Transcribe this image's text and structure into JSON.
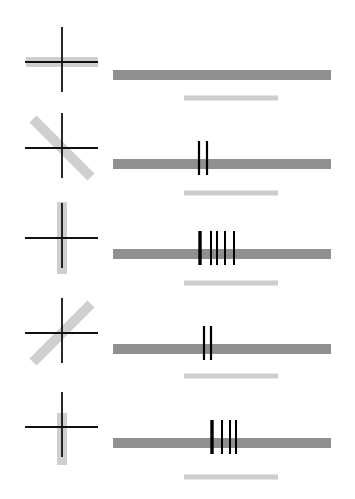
{
  "diagram": {
    "colors": {
      "crosshair": "#111111",
      "orientation_bar": "#cfcfcf",
      "long_bar": "#8f8f8f",
      "short_bar": "#cdcdcd",
      "fringe": "#000000"
    },
    "rows": [
      {
        "index": 1,
        "orientation_deg": 0,
        "orientation_label": "horizontal",
        "cx": 62,
        "cy": 62,
        "bar_len": 72,
        "long_bar_y": 75,
        "short_bar_y": 98,
        "fringes": []
      },
      {
        "index": 2,
        "orientation_deg": 45,
        "orientation_label": "diagonal-down",
        "cx": 62,
        "cy": 148,
        "bar_len": 82,
        "long_bar_y": 164,
        "short_bar_y": 193,
        "fringes": [
          {
            "x": 199,
            "w": 2.2
          },
          {
            "x": 207,
            "w": 2.2
          }
        ]
      },
      {
        "index": 3,
        "orientation_deg": 90,
        "orientation_label": "vertical",
        "cx": 62,
        "cy": 238,
        "bar_len": 72,
        "long_bar_y": 254,
        "short_bar_y": 283,
        "fringes": [
          {
            "x": 200,
            "w": 3.4
          },
          {
            "x": 211,
            "w": 2
          },
          {
            "x": 217,
            "w": 2
          },
          {
            "x": 225,
            "w": 2
          },
          {
            "x": 234,
            "w": 2
          }
        ]
      },
      {
        "index": 4,
        "orientation_deg": -45,
        "orientation_label": "diagonal-up",
        "cx": 62,
        "cy": 333,
        "bar_len": 82,
        "long_bar_y": 349,
        "short_bar_y": 376,
        "fringes": [
          {
            "x": 204,
            "w": 2.2
          },
          {
            "x": 211,
            "w": 2.2
          }
        ]
      },
      {
        "index": 5,
        "orientation_deg": 90,
        "orientation_label": "vertical-short",
        "cx": 62,
        "cy": 427,
        "bar_len": 52,
        "bar_offset": 12,
        "long_bar_y": 443,
        "short_bar_y": 477,
        "fringes": [
          {
            "x": 212,
            "w": 3.4
          },
          {
            "x": 222,
            "w": 2
          },
          {
            "x": 230,
            "w": 2
          },
          {
            "x": 236,
            "w": 2
          }
        ]
      }
    ]
  }
}
